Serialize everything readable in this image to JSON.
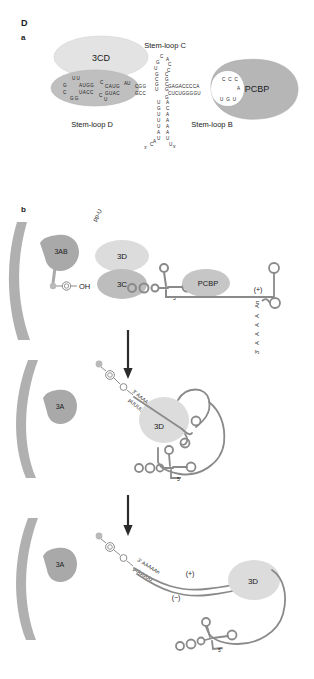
{
  "figure": {
    "panel_letter": "D",
    "subpanel_a": "a",
    "subpanel_b": "b"
  },
  "panel_a": {
    "proteins": [
      {
        "name": "3CD",
        "fill": "#e3e3e3"
      },
      {
        "name": "PCBP",
        "fill": "#b6b6b6"
      }
    ],
    "stem_loop_labels": {
      "c": "Stem-loop C",
      "d": "Stem-loop D",
      "b": "Stem-loop B"
    },
    "stem_loop_d": {
      "loop_top": "U U",
      "loop_left_top": "G",
      "loop_left_bottom": "C",
      "loop_bottom": "G G",
      "stem_top": "AUGG",
      "stem_bottom": "UACC",
      "bulge_top": "C",
      "bulge_bottom": "U",
      "bulge_mid": "C",
      "stem2_top": "CAUG",
      "stem2_bottom": "GUAC"
    },
    "stem_loop_c": {
      "loop_top_left": "C",
      "loop_top_right": "A",
      "left_col": "G U",
      "right_col": "C C",
      "stem_left": "G C G U",
      "stem_right": "C G C G",
      "junction_left": "AU",
      "junction_top": "CGG",
      "junction_bottom": "GCC"
    },
    "stem_loop_b": {
      "stem_top": "GAGACCCCA",
      "stem_bottom": "CUCUGGGGU",
      "loop_top": "C C C",
      "loop_right": "A",
      "loop_bottom": "U G U",
      "five_prime_g": "G"
    },
    "basal_stem": {
      "left_col": "U G U U U A U",
      "right_col": "A C A A A A U",
      "bottom_left": "C A",
      "three_prime": "3'",
      "five_prime": "5'",
      "bottom_right": "U"
    }
  },
  "panel_b": {
    "step1": {
      "membrane_label": "",
      "protein_3ab": "3AB",
      "protein_3d": "3D",
      "protein_3c": "3C",
      "protein_pcbp": "PCBP",
      "vpg_oh": "OH",
      "ppu": "pp-U",
      "five_prime": "5'",
      "strand_plus": "(+)",
      "polyA": "An",
      "polyA_residues": "A A A A",
      "three_prime": "3'"
    },
    "step2": {
      "protein_3a": "3A",
      "protein_3d": "3D",
      "template_top": "3' AAAAAn",
      "template_bottom": "pUUUUU",
      "five_prime": "5'"
    },
    "step3": {
      "protein_3a": "3A",
      "protein_3d": "3D",
      "template_top": "3' AAAAAn",
      "template_bottom": "pUUUUU",
      "strand_plus": "(+)",
      "strand_minus": "(−)",
      "five_prime": "5'"
    }
  },
  "colors": {
    "rna_stroke": "#7f7f7f",
    "protein_light": "#e3e3e3",
    "protein_mid": "#c9c9c9",
    "protein_dark": "#b6b6b6",
    "membrane": "#b0b0b0",
    "text": "#1a1a1a",
    "arrow": "#2b2b2b"
  }
}
